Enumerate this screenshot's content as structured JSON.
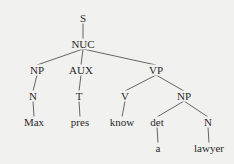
{
  "tree": {
    "nodes": [
      {
        "id": "S",
        "label": "S"
      },
      {
        "id": "NUC",
        "label": "NUC"
      },
      {
        "id": "NP1",
        "label": "NP"
      },
      {
        "id": "AUX",
        "label": "AUX"
      },
      {
        "id": "VP",
        "label": "VP"
      },
      {
        "id": "N1",
        "label": "N"
      },
      {
        "id": "T",
        "label": "T"
      },
      {
        "id": "V",
        "label": "V"
      },
      {
        "id": "NP2",
        "label": "NP"
      },
      {
        "id": "Max",
        "label": "Max"
      },
      {
        "id": "pres",
        "label": "pres"
      },
      {
        "id": "know",
        "label": "know"
      },
      {
        "id": "det",
        "label": "det"
      },
      {
        "id": "N2",
        "label": "N"
      },
      {
        "id": "a",
        "label": "a"
      },
      {
        "id": "lawyer",
        "label": "lawyer"
      }
    ],
    "edges": [
      [
        "S",
        "NUC"
      ],
      [
        "NUC",
        "NP1"
      ],
      [
        "NUC",
        "AUX"
      ],
      [
        "NUC",
        "VP"
      ],
      [
        "NP1",
        "N1"
      ],
      [
        "AUX",
        "T"
      ],
      [
        "VP",
        "V"
      ],
      [
        "VP",
        "NP2"
      ],
      [
        "N1",
        "Max"
      ],
      [
        "T",
        "pres"
      ],
      [
        "V",
        "know"
      ],
      [
        "NP2",
        "det"
      ],
      [
        "NP2",
        "N2"
      ],
      [
        "det",
        "a"
      ],
      [
        "N2",
        "lawyer"
      ]
    ]
  }
}
